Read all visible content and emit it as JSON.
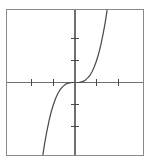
{
  "figure": {
    "frame": {
      "border_color": "#8a8a8a",
      "background_color": "#ffffff"
    },
    "axis_color": "#6f6f6f",
    "tick_color": "#4a4a4a",
    "curve_color": "#4b4b4b"
  },
  "chart_data": {
    "type": "line",
    "title": "",
    "subtitle": "",
    "xlabel": "",
    "ylabel": "",
    "function": "y = x^3",
    "xlim": [
      -3.15,
      3.15
    ],
    "ylim": [
      -3.3,
      3.3
    ],
    "grid": false,
    "legend": null,
    "legend_position": "none",
    "origin": {
      "x": 0,
      "y": 0
    },
    "xticks": [
      -2,
      -1,
      1,
      2
    ],
    "xtick_labels": [
      "",
      "",
      "",
      ""
    ],
    "yticks": [
      -2,
      -1,
      1,
      2
    ],
    "ytick_labels": [
      "",
      "",
      "",
      ""
    ],
    "tick_spacing_x": 1,
    "tick_spacing_y": 1,
    "annotations": [],
    "series": [
      {
        "name": "y = x^3",
        "color": "#4b4b4b",
        "x": [
          -1.49,
          -1.4,
          -1.3,
          -1.2,
          -1.1,
          -1.0,
          -0.9,
          -0.8,
          -0.7,
          -0.6,
          -0.5,
          -0.4,
          -0.3,
          -0.2,
          -0.1,
          0.0,
          0.1,
          0.2,
          0.3,
          0.4,
          0.5,
          0.6,
          0.7,
          0.8,
          0.9,
          1.0,
          1.1,
          1.2,
          1.3,
          1.4,
          1.49
        ],
        "y": [
          -3.31,
          -2.74,
          -2.2,
          -1.73,
          -1.33,
          -1.0,
          -0.73,
          -0.51,
          -0.34,
          -0.22,
          -0.13,
          -0.06,
          -0.03,
          -0.01,
          0.0,
          0.0,
          0.0,
          0.01,
          0.03,
          0.06,
          0.13,
          0.22,
          0.34,
          0.51,
          0.73,
          1.0,
          1.33,
          1.73,
          2.2,
          2.74,
          3.31
        ]
      }
    ]
  }
}
